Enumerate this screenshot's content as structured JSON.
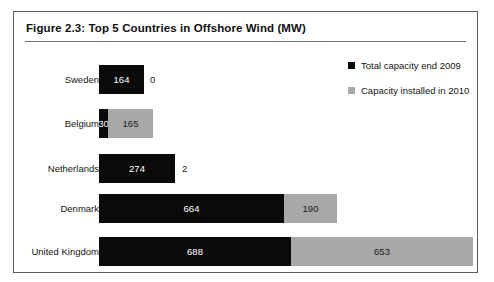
{
  "figure": {
    "title": "Figure 2.3:  Top 5 Countries in Offshore Wind (MW)"
  },
  "legend": {
    "items": [
      {
        "label": "Total capacity end 2009",
        "color": "#0a0a0a",
        "swatch_name": "legend-swatch-dark"
      },
      {
        "label": "Capacity installed in 2010",
        "color": "#a8a8a8",
        "swatch_name": "legend-swatch-light"
      }
    ]
  },
  "chart_data": {
    "type": "bar",
    "orientation": "horizontal",
    "stacked": true,
    "title": "Figure 2.3:  Top 5 Countries in Offshore Wind (MW)",
    "xlabel": "",
    "ylabel": "",
    "unit": "MW",
    "grid": false,
    "legend_position": "right",
    "axis_visible": false,
    "xlim": [
      0,
      1400
    ],
    "categories": [
      "Sweden",
      "Belgium",
      "Netherlands",
      "Denmark",
      "United Kingdom"
    ],
    "series": [
      {
        "name": "Total capacity end 2009",
        "color": "#0a0a0a",
        "values": [
          164,
          30,
          274,
          664,
          688
        ],
        "labels": [
          "164",
          "30",
          "274",
          "664",
          "688"
        ]
      },
      {
        "name": "Capacity installed in 2010",
        "color": "#a8a8a8",
        "values": [
          0,
          165,
          2,
          190,
          653
        ],
        "labels": [
          "0",
          "165",
          "2",
          "190",
          "653"
        ]
      }
    ],
    "totals": [
      164,
      195,
      276,
      854,
      1341
    ]
  },
  "rows": [
    {
      "country": "Sweden",
      "dark_label": "164",
      "light_label": "0",
      "dark_px": 45,
      "light_px": 0,
      "light_outside": true,
      "dark_narrow": false
    },
    {
      "country": "Belgium",
      "dark_label": "30",
      "light_label": "165",
      "dark_px": 9,
      "light_px": 45,
      "light_outside": false,
      "dark_narrow": true
    },
    {
      "country": "Netherlands",
      "dark_label": "274",
      "light_label": "2",
      "dark_px": 76,
      "light_px": 1,
      "light_outside": true,
      "dark_narrow": false
    },
    {
      "country": "Denmark",
      "dark_label": "664",
      "light_label": "190",
      "dark_px": 185,
      "light_px": 53,
      "light_outside": false,
      "dark_narrow": false
    },
    {
      "country": "United Kingdom",
      "dark_label": "688",
      "light_label": "653",
      "dark_px": 192,
      "light_px": 182,
      "light_outside": false,
      "dark_narrow": false
    }
  ],
  "layout": {
    "row_tops": [
      21,
      65,
      110,
      150,
      193
    ]
  }
}
